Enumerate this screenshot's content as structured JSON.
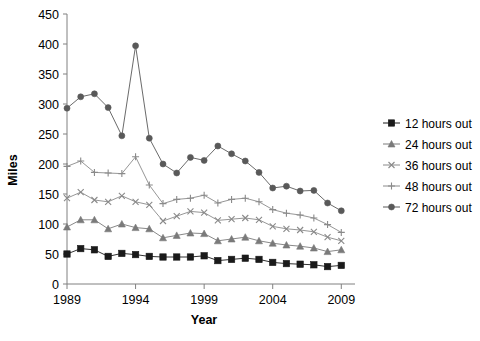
{
  "chart_data": {
    "type": "line",
    "title": "",
    "xlabel": "Year",
    "ylabel": "Miles",
    "xlim": [
      1989,
      2010
    ],
    "ylim": [
      0,
      450
    ],
    "ytick_values": [
      0,
      50,
      100,
      150,
      200,
      250,
      300,
      350,
      400,
      450
    ],
    "ytick_labels": [
      "0",
      "50",
      "100",
      "150",
      "200",
      "250",
      "300",
      "350",
      "400",
      "450"
    ],
    "xtick_values": [
      1989,
      1994,
      1999,
      2004,
      2009
    ],
    "xtick_labels": [
      "1989",
      "1994",
      "1999",
      "2004",
      "2009"
    ],
    "grid": false,
    "legend_position": "right",
    "x": [
      1989,
      1990,
      1991,
      1992,
      1993,
      1994,
      1995,
      1996,
      1997,
      1998,
      1999,
      2000,
      2001,
      2002,
      2003,
      2004,
      2005,
      2006,
      2007,
      2008,
      2009
    ],
    "series": [
      {
        "name": "12 hours out",
        "marker": "square",
        "color": "#1a1a1a",
        "values": [
          50,
          59,
          57,
          46,
          51,
          49,
          46,
          45,
          45,
          45,
          47,
          39,
          41,
          43,
          41,
          36,
          34,
          33,
          32,
          29,
          31
        ]
      },
      {
        "name": "24 hours out",
        "marker": "triangle",
        "color": "#7a7a7a",
        "values": [
          95,
          107,
          107,
          92,
          100,
          94,
          92,
          77,
          81,
          85,
          84,
          72,
          75,
          78,
          72,
          68,
          65,
          63,
          60,
          54,
          57
        ]
      },
      {
        "name": "36 hours out",
        "marker": "x",
        "color": "#8a8a8a",
        "values": [
          143,
          153,
          140,
          137,
          147,
          137,
          132,
          105,
          113,
          121,
          119,
          106,
          108,
          110,
          107,
          96,
          92,
          90,
          87,
          78,
          72
        ]
      },
      {
        "name": "48 hours out",
        "marker": "plus",
        "color": "#8a8a8a",
        "values": [
          196,
          205,
          186,
          185,
          184,
          212,
          165,
          134,
          141,
          143,
          148,
          135,
          141,
          143,
          137,
          124,
          118,
          115,
          110,
          99,
          86
        ]
      },
      {
        "name": "72 hours out",
        "marker": "circle",
        "color": "#595959",
        "values": [
          293,
          312,
          317,
          294,
          247,
          397,
          243,
          200,
          185,
          211,
          206,
          230,
          217,
          205,
          186,
          160,
          163,
          155,
          156,
          135,
          122
        ]
      }
    ]
  },
  "legend": {
    "items": [
      {
        "label": "12 hours out"
      },
      {
        "label": "24 hours out"
      },
      {
        "label": "36 hours out"
      },
      {
        "label": "48 hours out"
      },
      {
        "label": "72 hours out"
      }
    ]
  },
  "axes": {
    "y_title": "Miles",
    "x_title": "Year"
  }
}
